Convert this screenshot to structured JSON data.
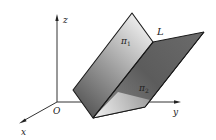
{
  "figure": {
    "labels": {
      "z_axis": "z",
      "y_axis": "y",
      "x_axis": "x",
      "origin": "O",
      "line": "L",
      "plane1": "π",
      "plane1_sub": "1",
      "plane2": "π",
      "plane2_sub": "2"
    },
    "colors": {
      "plane1_light": "#e4e4e4",
      "plane1_dark": "#6a6a6a",
      "plane2_dark": "#5e5e5e",
      "plane2_light": "#c8c8c8",
      "edge": "#1a1a1a",
      "axis": "#333333"
    }
  }
}
